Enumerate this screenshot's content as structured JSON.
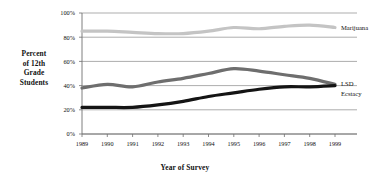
{
  "chart_data": {
    "type": "line",
    "title": "",
    "xlabel": "Year of Survey",
    "ylabel": "Percent of 12th Grade Students",
    "ylabel_lines": [
      "Percent",
      "of 12th",
      "Grade",
      "Students"
    ],
    "categories": [
      "1989",
      "1990",
      "1991",
      "1992",
      "1993",
      "1994",
      "1995",
      "1996",
      "1997",
      "1998",
      "1999"
    ],
    "x": [
      1989,
      1990,
      1991,
      1992,
      1993,
      1994,
      1995,
      1996,
      1997,
      1998,
      1999
    ],
    "ylim": [
      0,
      100
    ],
    "yticks": [
      0,
      20,
      40,
      60,
      80,
      100
    ],
    "ytick_labels": [
      "0%",
      "20%",
      "40%",
      "60%",
      "80%",
      "100%"
    ],
    "grid": true,
    "legend_position": "right-inline",
    "series": [
      {
        "name": "Marijuana",
        "color": "#c4c4c4",
        "values": [
          85,
          85,
          84,
          83,
          83,
          85,
          88,
          87,
          89,
          90,
          88
        ]
      },
      {
        "name": "LSD",
        "color": "#6e6e6e",
        "values": [
          38,
          41,
          39,
          43,
          46,
          50,
          54,
          52,
          49,
          46,
          41
        ]
      },
      {
        "name": "Ecstacy",
        "color": "#141414",
        "values": [
          22,
          22,
          22,
          24,
          27,
          31,
          34,
          37,
          39,
          39,
          40
        ]
      }
    ]
  },
  "axis": {
    "y_tick_labels": [
      "100%",
      "80%",
      "60%",
      "40%",
      "20%",
      "0%"
    ],
    "x_tick_labels": [
      "1989",
      "1990",
      "1991",
      "1992",
      "1993",
      "1994",
      "1995",
      "1996",
      "1997",
      "1998",
      "1999"
    ]
  },
  "labels": {
    "y_title_line1": "Percent",
    "y_title_line2": "of 12th",
    "y_title_line3": "Grade",
    "y_title_line4": "Students",
    "x_title": "Year of Survey",
    "series_marijuana": "Marijuana",
    "series_lsd": "LSD",
    "series_ecstacy": "Ecstacy"
  },
  "colors": {
    "marijuana": "#c4c4c4",
    "lsd": "#6e6e6e",
    "ecstacy": "#141414",
    "grid": "#8a8a8a",
    "axis": "#6f6f6f",
    "text": "#111111",
    "background": "#ffffff"
  },
  "geometry": {
    "plot_left": 82,
    "plot_right": 335,
    "plot_top": 13,
    "plot_bottom": 134
  }
}
